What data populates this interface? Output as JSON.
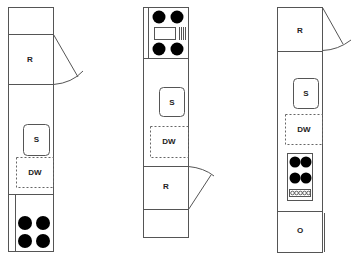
{
  "diagram": {
    "title": "",
    "layouts": [
      {
        "id": "left",
        "appliances": [
          {
            "code": "R",
            "name": "refrigerator"
          },
          {
            "code": "S",
            "name": "sink"
          },
          {
            "code": "DW",
            "name": "dishwasher"
          },
          {
            "code": "",
            "name": "cooktop",
            "burners": 4
          }
        ]
      },
      {
        "id": "middle",
        "appliances": [
          {
            "code": "",
            "name": "cooktop",
            "burners": 4
          },
          {
            "code": "S",
            "name": "sink"
          },
          {
            "code": "DW",
            "name": "dishwasher"
          },
          {
            "code": "R",
            "name": "refrigerator"
          }
        ]
      },
      {
        "id": "right",
        "appliances": [
          {
            "code": "R",
            "name": "refrigerator"
          },
          {
            "code": "S",
            "name": "sink"
          },
          {
            "code": "DW",
            "name": "dishwasher"
          },
          {
            "code": "",
            "name": "cooktop",
            "burners": 4,
            "knobs": 5
          },
          {
            "code": "O",
            "name": "oven"
          }
        ]
      }
    ]
  },
  "labels": {
    "left_r": "R",
    "left_s": "S",
    "left_dw": "DW",
    "mid_s": "S",
    "mid_dw": "DW",
    "mid_r": "R",
    "right_r": "R",
    "right_s": "S",
    "right_dw": "DW",
    "right_o": "O"
  },
  "colors": {
    "stroke": "#555555",
    "burner": "#000000",
    "background": "#ffffff"
  }
}
